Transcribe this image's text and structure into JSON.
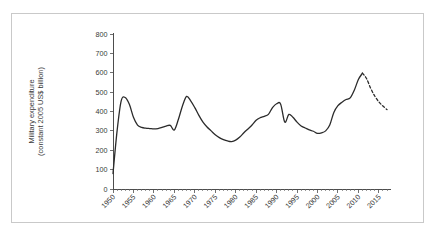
{
  "chart_data": {
    "type": "line",
    "title": "",
    "xlabel": "",
    "ylabel": "Military expenditure (constant 2005 US$ billion)",
    "ylabel_line1": "Military expenditure",
    "ylabel_line2": "(constant 2005 US$ billion)",
    "xlim": [
      1950,
      2017
    ],
    "ylim": [
      0,
      800
    ],
    "ytick_labels": [
      "0",
      "100",
      "200",
      "300",
      "400",
      "500",
      "600",
      "700",
      "800"
    ],
    "ytick_values": [
      0,
      100,
      200,
      300,
      400,
      500,
      600,
      700,
      800
    ],
    "xtick_labels": [
      "1950",
      "1955",
      "1960",
      "1965",
      "1970",
      "1975",
      "1980",
      "1985",
      "1990",
      "1995",
      "2000",
      "2005",
      "2010",
      "2015"
    ],
    "xtick_values": [
      1950,
      1955,
      1960,
      1965,
      1970,
      1975,
      1980,
      1985,
      1990,
      1995,
      2000,
      2005,
      2010,
      2015
    ],
    "x_minor_tick_interval": 1,
    "grid": false,
    "legend": false,
    "legend_position": "none",
    "line_color": "#2b2b2b",
    "series": [
      {
        "name": "Military expenditure (actual)",
        "style": "solid",
        "x": [
          1950,
          1951,
          1952,
          1953,
          1954,
          1955,
          1956,
          1957,
          1958,
          1959,
          1960,
          1961,
          1962,
          1963,
          1964,
          1965,
          1966,
          1967,
          1968,
          1969,
          1970,
          1971,
          1972,
          1973,
          1974,
          1975,
          1976,
          1977,
          1978,
          1979,
          1980,
          1981,
          1982,
          1983,
          1984,
          1985,
          1986,
          1987,
          1988,
          1989,
          1990,
          1991,
          1992,
          1993,
          1994,
          1995,
          1996,
          1997,
          1998,
          1999,
          2000,
          2001,
          2002,
          2003,
          2004,
          2005,
          2006,
          2007,
          2008,
          2009,
          2010,
          2011
        ],
        "values": [
          80,
          300,
          455,
          472,
          437,
          370,
          330,
          318,
          314,
          312,
          310,
          312,
          318,
          325,
          328,
          305,
          360,
          430,
          478,
          455,
          420,
          380,
          345,
          320,
          300,
          280,
          265,
          255,
          248,
          245,
          252,
          268,
          290,
          310,
          330,
          355,
          368,
          375,
          385,
          420,
          440,
          438,
          345,
          385,
          370,
          345,
          325,
          315,
          305,
          298,
          287,
          290,
          300,
          330,
          395,
          430,
          448,
          462,
          470,
          510,
          565,
          598
        ]
      },
      {
        "name": "Military expenditure (projected)",
        "style": "dashed",
        "x": [
          2011,
          2012,
          2013,
          2014,
          2015,
          2016,
          2017
        ],
        "values": [
          598,
          570,
          520,
          480,
          450,
          428,
          410
        ]
      }
    ],
    "annotations": []
  },
  "figure": {
    "background_color": "#ffffff",
    "border_color": "#c9c9c9",
    "axis_color": "#4d4d4d"
  }
}
